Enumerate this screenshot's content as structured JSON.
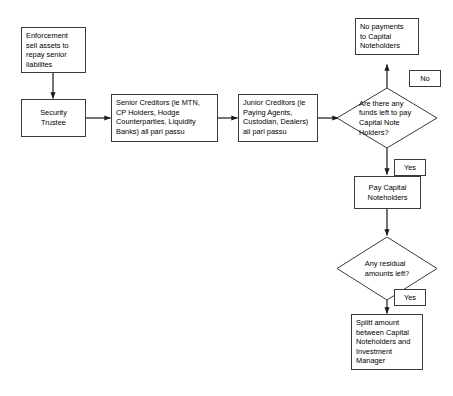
{
  "diagram": {
    "type": "flowchart",
    "title": "",
    "background_color": "#ffffff",
    "line_color": "#3a3a3a",
    "text_color": "#000000",
    "nodes": [
      {
        "id": "enforcement",
        "shape": "rectangle",
        "label": "Enforcement\nsell assets to\nrepay senior\nliabilites",
        "align": "left"
      },
      {
        "id": "security-trustee",
        "shape": "rectangle",
        "label": "Security\nTrustee",
        "align": "center"
      },
      {
        "id": "senior-creditors",
        "shape": "rectangle",
        "label": "Senior Creditors (ie MTN,\nCP Holders, Hodge\nCounterparties, Liquidity\nBanks) all pari passu",
        "align": "left"
      },
      {
        "id": "junior-creditors",
        "shape": "rectangle",
        "label": "Junior Creditors (ie\nPaying Agents,\nCustodian, Dealers)\nall pari passu",
        "align": "left"
      },
      {
        "id": "no-payments",
        "shape": "rectangle",
        "label": "No payments\nto Capital\nNoteholders",
        "align": "left"
      },
      {
        "id": "funds-left-decision",
        "shape": "diamond",
        "label": "Are there any\nfunds left to pay\nCapital Note\nHolders?",
        "align": "left"
      },
      {
        "id": "pay-capital-noteholders",
        "shape": "rectangle",
        "label": "Pay Capital\nNoteholders",
        "align": "center"
      },
      {
        "id": "residual-decision",
        "shape": "diamond",
        "label": "Any residual\namounts left?",
        "align": "center"
      },
      {
        "id": "split-amount",
        "shape": "rectangle",
        "label": "Splitt amount\nbetween Capital\nNoteholders and\nInvestment\nManager",
        "align": "left"
      }
    ],
    "edge_labels": [
      {
        "id": "no-label",
        "label": "No"
      },
      {
        "id": "yes-label-funds",
        "label": "Yes"
      },
      {
        "id": "yes-label-residual",
        "label": "Yes"
      }
    ]
  }
}
